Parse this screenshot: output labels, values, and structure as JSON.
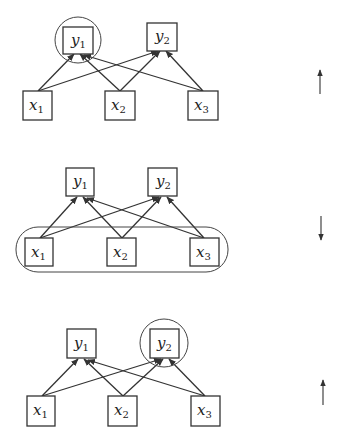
{
  "diagram": {
    "stroke_color": "#333333",
    "panels": [
      {
        "id": "top",
        "highlight": {
          "type": "circle",
          "target": "y1"
        },
        "direction_arrow": "up",
        "outputs": [
          {
            "name": "y",
            "sub": "1"
          },
          {
            "name": "y",
            "sub": "2"
          }
        ],
        "inputs": [
          {
            "name": "x",
            "sub": "1"
          },
          {
            "name": "x",
            "sub": "2"
          },
          {
            "name": "x",
            "sub": "3"
          }
        ]
      },
      {
        "id": "middle",
        "highlight": {
          "type": "rounded-rect",
          "target": "x1,x2,x3"
        },
        "direction_arrow": "down",
        "outputs": [
          {
            "name": "y",
            "sub": "1"
          },
          {
            "name": "y",
            "sub": "2"
          }
        ],
        "inputs": [
          {
            "name": "x",
            "sub": "1"
          },
          {
            "name": "x",
            "sub": "2"
          },
          {
            "name": "x",
            "sub": "3"
          }
        ]
      },
      {
        "id": "bottom",
        "highlight": {
          "type": "circle",
          "target": "y2"
        },
        "direction_arrow": "up",
        "outputs": [
          {
            "name": "y",
            "sub": "1"
          },
          {
            "name": "y",
            "sub": "2"
          }
        ],
        "inputs": [
          {
            "name": "x",
            "sub": "1"
          },
          {
            "name": "x",
            "sub": "2"
          },
          {
            "name": "x",
            "sub": "3"
          }
        ]
      }
    ]
  }
}
